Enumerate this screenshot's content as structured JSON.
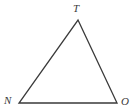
{
  "figure": {
    "type": "triangle-diagram",
    "background_color": "#ffffff",
    "stroke_color": "#3a3a3a",
    "stroke_width": 1.3,
    "label_color": "#3a3a3a",
    "vertices": [
      {
        "id": "T",
        "label": "T",
        "x": 78,
        "y": 20,
        "label_x": 73,
        "label_y": 3
      },
      {
        "id": "N",
        "label": "N",
        "x": 19,
        "y": 103,
        "label_x": 4,
        "label_y": 95
      },
      {
        "id": "O",
        "label": "O",
        "x": 117,
        "y": 103,
        "label_x": 121,
        "label_y": 96
      }
    ],
    "edges": [
      {
        "id": "NT",
        "from": "N",
        "to": "T"
      },
      {
        "id": "TO",
        "from": "T",
        "to": "O"
      },
      {
        "id": "NO",
        "from": "N",
        "to": "O"
      }
    ],
    "polygon_points": "78,20 117,103 19,103"
  }
}
